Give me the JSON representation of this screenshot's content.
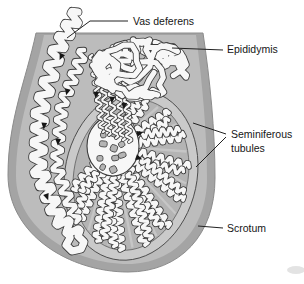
{
  "labels": {
    "vas_deferens": "Vas deferens",
    "epididymis": "Epididymis",
    "seminiferous_tubules_line1": "Seminiferous",
    "seminiferous_tubules_line2": "tubules",
    "scrotum": "Scrotum"
  },
  "colors": {
    "background": "#ffffff",
    "scrotum_wall": "#a4a4a4",
    "scrotum_wall_edge": "#8c8c8c",
    "scrotum_interior": "#bcbcbc",
    "tunica_albuginea": "#cacaca",
    "tunica_outline": "#4a4a4a",
    "testis_interior": "#b4b4b4",
    "testis_inner_outline": "#565656",
    "septum": "#c8c8c8",
    "tubule_fill": "#f7f7f7",
    "tubule_outline": "#3c3c3c",
    "arrow": "#161616",
    "leader_line": "#222222",
    "label_text": "#161616",
    "shadow": "#dcdcdc"
  }
}
